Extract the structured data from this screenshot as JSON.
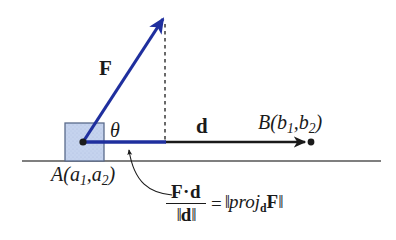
{
  "figure": {
    "background_color": "#ffffff"
  },
  "colors": {
    "vector_blue": "#1f2f9e",
    "block_fill": "#c5d3ee",
    "block_stroke": "#5a6b8c",
    "line_black": "#1a1a1a",
    "ground_gray": "#555555"
  },
  "labels": {
    "force_vector": "F",
    "angle": "θ",
    "displacement_vector": "d",
    "point_b": "B(b",
    "point_b_sub1": "1",
    "point_b_mid": ",b",
    "point_b_sub2": "2",
    "point_b_close": ")",
    "point_a": "A(a",
    "point_a_sub1": "1",
    "point_a_mid": ",a",
    "point_a_sub2": "2",
    "point_a_close": ")"
  },
  "formula": {
    "numerator": "F·d",
    "denominator_open": "‖",
    "denominator_var": "d",
    "denominator_close": "‖",
    "equals": "=",
    "rhs_bar_open": "‖",
    "rhs_proj": "proj",
    "rhs_proj_sub": "d",
    "rhs_F": "F",
    "rhs_bar_close": "‖",
    "plain_text": "(F·d)/‖d‖ = ‖proj_d F‖"
  },
  "geometry": {
    "point_a": [
      83,
      142
    ],
    "point_b": [
      311,
      142
    ],
    "force_tip": [
      163,
      19
    ],
    "projection_end": [
      165,
      142
    ],
    "ground_y": 161,
    "ground_x_start": 22,
    "ground_x_end": 381,
    "block": {
      "x": 65,
      "y": 123,
      "width": 39,
      "height": 38
    },
    "dashed_line_x": 165,
    "dashed_line_from_y": 24,
    "dashed_line_to_y": 142
  }
}
